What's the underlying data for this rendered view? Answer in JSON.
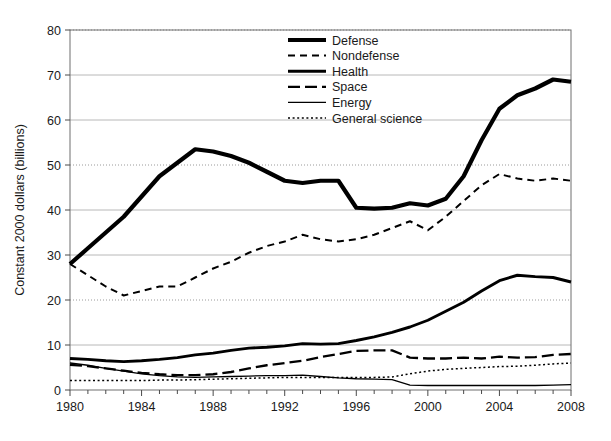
{
  "chart_data": {
    "type": "line",
    "title": "",
    "xlabel": "",
    "ylabel": "Constant 2000 dollars (billions)",
    "xlim": [
      1980,
      2008
    ],
    "ylim": [
      0,
      80
    ],
    "ytick_step": 10,
    "xtick_step": 4,
    "x_minor_step": 1,
    "grid": true,
    "legend_position": "top-center",
    "yticks": [
      "0",
      "10",
      "20",
      "30",
      "40",
      "50",
      "60",
      "70",
      "80"
    ],
    "xticks": [
      "1980",
      "1984",
      "1988",
      "1992",
      "1996",
      "2000",
      "2004",
      "2008"
    ],
    "x": [
      1980,
      1981,
      1982,
      1983,
      1984,
      1985,
      1986,
      1987,
      1988,
      1989,
      1990,
      1991,
      1992,
      1993,
      1994,
      1995,
      1996,
      1997,
      1998,
      1999,
      2000,
      2001,
      2002,
      2003,
      2004,
      2005,
      2006,
      2007,
      2008
    ],
    "series": [
      {
        "name": "Defense",
        "style": "thick-solid",
        "stroke_width": 4.2,
        "dasharray": "none",
        "values": [
          28.0,
          31.5,
          35.0,
          38.5,
          43.0,
          47.5,
          50.5,
          53.5,
          53.0,
          52.0,
          50.5,
          48.5,
          46.5,
          46.0,
          46.5,
          46.5,
          40.5,
          40.3,
          40.5,
          41.5,
          41.0,
          42.5,
          47.5,
          55.5,
          62.5,
          65.5,
          67.0,
          69.0,
          68.5
        ]
      },
      {
        "name": "Nondefense",
        "style": "short-dash",
        "stroke_width": 2.0,
        "dasharray": "7 5",
        "values": [
          28.0,
          25.5,
          23.0,
          21.0,
          22.0,
          23.0,
          23.0,
          25.0,
          27.0,
          28.5,
          30.5,
          32.0,
          33.0,
          34.5,
          33.5,
          33.0,
          33.5,
          34.5,
          36.0,
          37.5,
          35.5,
          38.5,
          42.0,
          45.5,
          48.0,
          47.0,
          46.5,
          47.0,
          46.5
        ]
      },
      {
        "name": "Health",
        "style": "medium-solid",
        "stroke_width": 2.9,
        "dasharray": "none",
        "values": [
          7.0,
          6.8,
          6.5,
          6.3,
          6.5,
          6.8,
          7.2,
          7.8,
          8.2,
          8.8,
          9.3,
          9.5,
          9.8,
          10.3,
          10.2,
          10.3,
          11.0,
          11.8,
          12.8,
          14.0,
          15.5,
          17.5,
          19.5,
          22.0,
          24.3,
          25.5,
          25.2,
          25.0,
          24.0
        ]
      },
      {
        "name": "Space",
        "style": "long-dash",
        "stroke_width": 2.3,
        "dasharray": "12 5",
        "values": [
          5.6,
          5.3,
          4.8,
          4.3,
          3.8,
          3.5,
          3.3,
          3.3,
          3.5,
          4.0,
          4.8,
          5.5,
          6.0,
          6.5,
          7.3,
          8.0,
          8.7,
          8.8,
          8.8,
          7.2,
          7.0,
          7.0,
          7.2,
          7.0,
          7.4,
          7.2,
          7.3,
          7.8,
          8.0
        ]
      },
      {
        "name": "Energy",
        "style": "thin-solid",
        "stroke_width": 1.3,
        "dasharray": "none",
        "values": [
          6.0,
          5.5,
          4.8,
          4.2,
          3.6,
          3.2,
          2.9,
          2.8,
          2.9,
          3.0,
          3.1,
          3.2,
          3.2,
          3.3,
          3.0,
          2.7,
          2.5,
          2.4,
          2.3,
          1.1,
          1.0,
          1.0,
          1.0,
          1.0,
          1.0,
          1.0,
          1.0,
          1.1,
          1.2
        ]
      },
      {
        "name": "General science",
        "style": "dotted",
        "stroke_width": 1.5,
        "dasharray": "2 2.6",
        "values": [
          2.1,
          2.1,
          2.1,
          2.1,
          2.1,
          2.2,
          2.2,
          2.3,
          2.4,
          2.5,
          2.6,
          2.7,
          2.8,
          2.8,
          2.8,
          2.8,
          2.8,
          2.8,
          2.9,
          3.6,
          4.2,
          4.6,
          4.8,
          5.0,
          5.2,
          5.3,
          5.5,
          5.8,
          6.0
        ]
      }
    ]
  },
  "legend": {
    "entries": [
      {
        "label": "Defense"
      },
      {
        "label": "Nondefense"
      },
      {
        "label": "Health"
      },
      {
        "label": "Space"
      },
      {
        "label": "Energy"
      },
      {
        "label": "General science"
      }
    ]
  }
}
